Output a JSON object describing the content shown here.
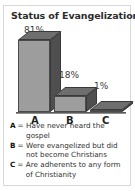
{
  "card": {
    "title": "Status of Evangelization",
    "frame_color": "#d8d8d8",
    "background": "#ffffff"
  },
  "chart_data": {
    "type": "bar",
    "title": "Status of Evangelization",
    "categories": [
      "A",
      "B",
      "C"
    ],
    "values": [
      81,
      18,
      1
    ],
    "data_labels": [
      "81%",
      "18%",
      "1%"
    ],
    "xlabel": "",
    "ylabel": "",
    "ylim": [
      0,
      100
    ],
    "grid": false,
    "legend_position": "below",
    "style": "3d-bar",
    "bar_face_color": "#9d9d9d",
    "bar_side_color": "#4f4f4f",
    "bar_top_color": "#6e6e6e",
    "legend": [
      {
        "key": "A",
        "eq": "=",
        "text": "Have never heard the gospel"
      },
      {
        "key": "B",
        "eq": "=",
        "text": "Were evangelized but did not become Christians"
      },
      {
        "key": "C",
        "eq": "=",
        "text": "Are adherents to any form of Christianity"
      }
    ]
  }
}
